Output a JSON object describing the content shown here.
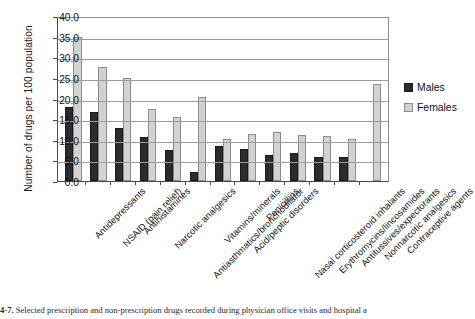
{
  "chart_data": {
    "type": "bar",
    "title": "",
    "xlabel": "",
    "ylabel": "Number of drugs per 100 population",
    "ylim": [
      0,
      40
    ],
    "ytick_step": 5,
    "ytick_labels": [
      "0.0",
      "5.0",
      "10.0",
      "15.0",
      "20.0",
      "25.0",
      "30.0",
      "35.0",
      "40.0"
    ],
    "grid": true,
    "legend_position": "right",
    "categories": [
      "Antidepressants",
      "NSAID (pain relief)",
      "Antihistamines",
      "Narcotic analgesics",
      "Antiasthmatics/bronchodilator",
      "Vitamins/minerals",
      "Acid/peptic disorders",
      "Penicillins",
      "Nasal corticosteroid inhalants",
      "Erythromycins/lincosamides",
      "Antitussives/expectorants",
      "Nonnarcotic analgesics",
      "Contraceptive agents"
    ],
    "series": [
      {
        "name": "Males",
        "color": "#2c2c2c",
        "values": [
          17.9,
          16.8,
          12.9,
          10.7,
          7.4,
          2.2,
          8.6,
          7.7,
          6.4,
          6.7,
          5.9,
          5.8,
          0.0
        ]
      },
      {
        "name": "Females",
        "color": "#d2d2d2",
        "values": [
          35.0,
          27.6,
          25.0,
          17.5,
          15.6,
          20.3,
          10.2,
          11.4,
          11.8,
          11.1,
          11.0,
          10.2,
          23.5
        ]
      }
    ]
  },
  "legend": {
    "items": [
      {
        "label": "Males",
        "key": "males-swatch"
      },
      {
        "label": "Females",
        "key": "females-swatch"
      }
    ]
  },
  "caption": {
    "number": "4-7.",
    "text": "Selected prescription and non-prescription drugs recorded during physician office visits and hospital a"
  }
}
